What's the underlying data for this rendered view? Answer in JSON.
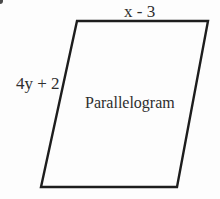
{
  "figure": {
    "type": "geometry-diagram",
    "shape": "parallelogram",
    "labels": {
      "top_side": "x - 3",
      "left_side": "4y + 2",
      "shape_name": "Parallelogram"
    },
    "colors": {
      "outline": "#1d1d1d",
      "text": "#2e2e2e",
      "background": "#fdfdfd"
    }
  }
}
